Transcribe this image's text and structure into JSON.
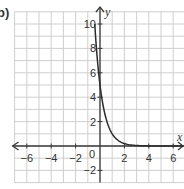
{
  "part_label": "b)",
  "chart_data": {
    "type": "line",
    "title": "",
    "xlabel": "x",
    "ylabel": "y",
    "xlim": [
      -7,
      7
    ],
    "ylim": [
      -3,
      11
    ],
    "grid": true,
    "grid_step": 1,
    "x_ticks": [
      -6,
      -4,
      -2,
      2,
      4,
      6
    ],
    "x_tick_labels": [
      "−6",
      "−4",
      "−2",
      "2",
      "4",
      "6"
    ],
    "y_ticks": [
      -2,
      2,
      4,
      6,
      8,
      10
    ],
    "y_tick_labels": [
      "−2",
      "2",
      "4",
      "6",
      "8",
      "10"
    ],
    "origin_label": "0",
    "series": [
      {
        "name": "exponential decay",
        "function": "y = 5 * (0.2)^x",
        "x": [
          -0.43,
          -0.25,
          0,
          0.25,
          0.5,
          1,
          1.5,
          2,
          3,
          4,
          5,
          6,
          7
        ],
        "y": [
          10,
          7.48,
          5,
          3.34,
          2.24,
          1,
          0.45,
          0.2,
          0.04,
          0.008,
          0.0016,
          0.0003,
          0.0001
        ]
      }
    ],
    "arrows": {
      "x_axis": "both",
      "y_axis": "up"
    }
  }
}
